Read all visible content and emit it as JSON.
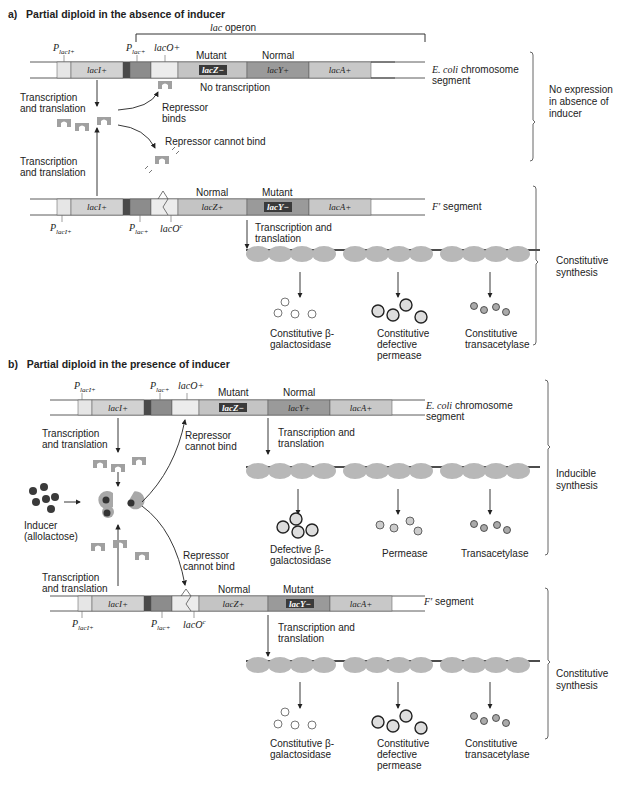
{
  "panels": [
    {
      "id": "a",
      "title_prefix": "a)",
      "title": "Partial diploid in the absence of inducer",
      "operon_label_italic": "lac",
      "operon_label": "operon",
      "chromosome": {
        "promoter_laci": "P",
        "promoter_laci_sub": "lacI+",
        "promoter_lac": "P",
        "promoter_lac_sub": "lac+",
        "operator": "lacO+",
        "genes": [
          "lacI+",
          "lacZ−",
          "lacY+",
          "lacA+"
        ],
        "status_labels": [
          "Mutant",
          "Normal"
        ],
        "segment_label_italic": "E. coli",
        "segment_label": "chromosome segment",
        "no_transcription": "No transcription"
      },
      "repressor_binds": "Repressor binds",
      "repressor_cannot_bind": "Repressor cannot bind",
      "transcription_top": "Transcription and translation",
      "transcription_bottom": "Transcription and translation",
      "fprime": {
        "genes": [
          "lacI+",
          "lacZ+",
          "lacY−",
          "lacA+"
        ],
        "status_labels": [
          "Normal",
          "Mutant"
        ],
        "promoter_laci": "P",
        "promoter_laci_sub": "lacI+",
        "promoter_lac": "P",
        "promoter_lac_sub": "lac+",
        "operator": "lacO",
        "operator_sup": "c",
        "segment_label_italic": "F′",
        "segment_label": "segment",
        "transcription": "Transcription and translation",
        "products": [
          "Constitutive β-galactosidase",
          "Constitutive defective permease",
          "Constitutive transacetylase"
        ]
      },
      "side_labels": [
        "No expression in absence of inducer",
        "Constitutive synthesis"
      ]
    },
    {
      "id": "b",
      "title_prefix": "b)",
      "title": "Partial diploid in the presence of inducer",
      "chromosome": {
        "promoter_laci": "P",
        "promoter_laci_sub": "lacI+",
        "promoter_lac": "P",
        "promoter_lac_sub": "lac+",
        "operator": "lacO+",
        "genes": [
          "lacI+",
          "lacZ−",
          "lacY+",
          "lacA+"
        ],
        "status_labels": [
          "Mutant",
          "Normal"
        ],
        "segment_label_italic": "E. coli",
        "segment_label": "chromosome segment",
        "transcription": "Transcription and translation",
        "products": [
          "Defective β-galactosidase",
          "Permease",
          "Transacetylase"
        ]
      },
      "transcription_top": "Transcription and translation",
      "transcription_bottom": "Transcription and translation",
      "repressor_cannot_bind_top": "Repressor cannot bind",
      "repressor_cannot_bind_bottom": "Repressor cannot bind",
      "inducer": "Inducer (allolactose)",
      "fprime": {
        "genes": [
          "lacI+",
          "lacZ+",
          "lacY−",
          "lacA+"
        ],
        "status_labels": [
          "Normal",
          "Mutant"
        ],
        "promoter_laci": "P",
        "promoter_laci_sub": "lacI+",
        "promoter_lac": "P",
        "promoter_lac_sub": "lac+",
        "operator": "lacO",
        "operator_sup": "c",
        "segment_label_italic": "F′",
        "segment_label": "segment",
        "transcription": "Transcription and translation",
        "products": [
          "Constitutive β-galactosidase",
          "Constitutive defective permease",
          "Constitutive transacetylase"
        ]
      },
      "side_labels": [
        "Inducible synthesis",
        "Constitutive synthesis"
      ]
    }
  ],
  "colors": {
    "laci": "#d2d2d2",
    "placi": "#e6e6e6",
    "plac_dark": "#4a4a4a",
    "plac": "#8c8c8c",
    "laco": "#ececec",
    "lacz": "#c4c4c4",
    "lacy": "#9a9a9a",
    "laca": "#c8c8c8",
    "mutant_box": "#3a3a3a",
    "ribosome": "#b8b8b8",
    "repressor": "#a8a8a8",
    "inducer": "#3a3a3a"
  }
}
